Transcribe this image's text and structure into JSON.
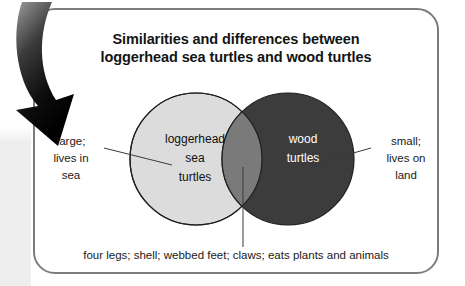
{
  "diagram": {
    "title_lines": [
      "Similarities and differences between",
      "loggerhead sea turtles and wood turtles"
    ],
    "type": "venn-diagram",
    "left_set": {
      "name_lines": [
        "loggerhead",
        "sea",
        "turtles"
      ],
      "fill_color": "#dcdcdc",
      "text_color": "#111111",
      "unique_traits_lines": [
        "large;",
        "lives in",
        "sea"
      ]
    },
    "right_set": {
      "name_lines": [
        "wood",
        "turtles"
      ],
      "fill_color": "#3c3c3c",
      "text_color": "#ffffff",
      "unique_traits_lines": [
        "small;",
        "lives on",
        "land"
      ]
    },
    "overlap": {
      "fill_color": "#7a7a7a",
      "shared_traits": "four legs; shell; webbed feet; claws; eats plants and animals"
    },
    "callout_arrow": {
      "icon": "curved-down-arrow-icon",
      "color": "#000000"
    },
    "card": {
      "border_color": "#7c7c7c",
      "background_color": "#ffffff"
    }
  }
}
